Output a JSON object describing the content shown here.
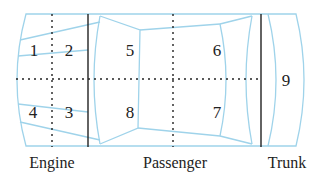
{
  "diagram": {
    "colors": {
      "outline": "#9fd3ea",
      "divider": "#222222",
      "text": "#222222"
    },
    "zones": [
      {
        "id": "1",
        "label": "1"
      },
      {
        "id": "2",
        "label": "2"
      },
      {
        "id": "3",
        "label": "3"
      },
      {
        "id": "4",
        "label": "4"
      },
      {
        "id": "5",
        "label": "5"
      },
      {
        "id": "6",
        "label": "6"
      },
      {
        "id": "7",
        "label": "7"
      },
      {
        "id": "8",
        "label": "8"
      },
      {
        "id": "9",
        "label": "9"
      }
    ],
    "sections": {
      "engine": "Engine",
      "passenger": "Passenger",
      "trunk": "Trunk"
    }
  }
}
